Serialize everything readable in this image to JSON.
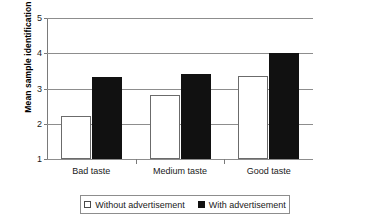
{
  "chart_data": {
    "type": "bar",
    "title": "",
    "xlabel": "",
    "ylabel": "Mean sample identification",
    "categories": [
      "Bad taste",
      "Medium taste",
      "Good taste"
    ],
    "series": [
      {
        "name": "Without advertisement",
        "values": [
          2.22,
          2.82,
          3.35
        ],
        "color": "#ffffff"
      },
      {
        "name": "With advertisement",
        "values": [
          3.34,
          3.42,
          4.0
        ],
        "color": "#111111"
      }
    ],
    "ylim": [
      1,
      5
    ],
    "yticks": [
      1,
      2,
      3,
      4,
      5
    ],
    "ytick_labels": [
      "1",
      "2",
      "3",
      "4",
      "5"
    ],
    "grid": "horizontal",
    "legend_position": "bottom"
  },
  "legend": {
    "items": [
      {
        "label": "Without advertisement",
        "swatch": "open-square-icon"
      },
      {
        "label": "With advertisement",
        "swatch": "filled-square-icon"
      }
    ]
  }
}
